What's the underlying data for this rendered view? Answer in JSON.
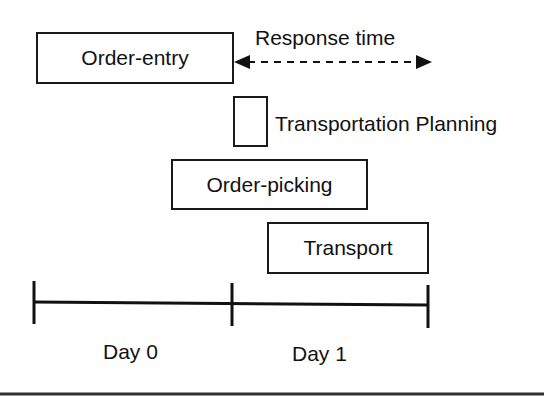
{
  "diagram": {
    "activities": [
      {
        "label": "Order-entry"
      },
      {
        "label": ""
      },
      {
        "label": "Order-picking"
      },
      {
        "label": "Transport"
      }
    ],
    "annotations": {
      "response_time": "Response time",
      "transportation_planning": "Transportation Planning"
    },
    "timeline": {
      "days": [
        "Day 0",
        "Day 1"
      ]
    }
  }
}
